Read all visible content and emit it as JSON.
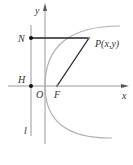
{
  "figure": {
    "colors": {
      "axis": "#999999",
      "parabola": "#aaaaaa",
      "segment": "#222222",
      "point": "#111111",
      "label": "#333333"
    },
    "labels": {
      "y_axis": "y",
      "x_axis": "x",
      "origin": "O",
      "focus": "F",
      "point_p": "P(x,y)",
      "point_n": "N",
      "point_h": "H",
      "directrix": "l"
    }
  }
}
